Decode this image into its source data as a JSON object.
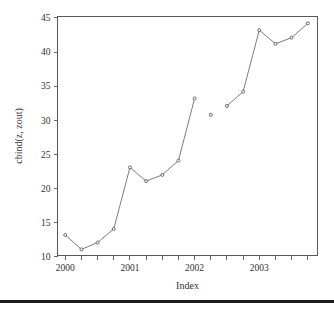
{
  "chart_data": {
    "type": "line",
    "title": "",
    "xlabel": "Index",
    "ylabel": "cbind(z, zout)",
    "xlim": [
      1999.88,
      2003.9
    ],
    "ylim": [
      10.2,
      45.2
    ],
    "grid": false,
    "legend": null,
    "x_ticks": [
      {
        "value": 2000,
        "label": "2000",
        "major": true
      },
      {
        "value": 2000.25,
        "label": "",
        "major": false
      },
      {
        "value": 2000.5,
        "label": "",
        "major": false
      },
      {
        "value": 2000.75,
        "label": "",
        "major": false
      },
      {
        "value": 2001,
        "label": "2001",
        "major": true
      },
      {
        "value": 2001.25,
        "label": "",
        "major": false
      },
      {
        "value": 2001.5,
        "label": "",
        "major": false
      },
      {
        "value": 2001.75,
        "label": "",
        "major": false
      },
      {
        "value": 2002,
        "label": "2002",
        "major": true
      },
      {
        "value": 2002.25,
        "label": "",
        "major": false
      },
      {
        "value": 2002.5,
        "label": "",
        "major": false
      },
      {
        "value": 2002.75,
        "label": "",
        "major": false
      },
      {
        "value": 2003,
        "label": "2003",
        "major": true
      },
      {
        "value": 2003.25,
        "label": "",
        "major": false
      },
      {
        "value": 2003.5,
        "label": "",
        "major": false
      },
      {
        "value": 2003.75,
        "label": "",
        "major": false
      }
    ],
    "y_ticks": [
      {
        "value": 10,
        "label": "10"
      },
      {
        "value": 15,
        "label": "15"
      },
      {
        "value": 20,
        "label": "20"
      },
      {
        "value": 25,
        "label": "25"
      },
      {
        "value": 30,
        "label": "30"
      },
      {
        "value": 35,
        "label": "35"
      },
      {
        "value": 40,
        "label": "40"
      },
      {
        "value": 45,
        "label": "45"
      }
    ],
    "x": [
      2000,
      2000.25,
      2000.5,
      2000.75,
      2001,
      2001.25,
      2001.5,
      2001.75,
      2002,
      2002.25,
      2002.5,
      2002.75,
      2003,
      2003.25,
      2003.5,
      2003.75
    ],
    "values": [
      13.2,
      11.1,
      12.1,
      14.1,
      23.1,
      21.1,
      22.0,
      24.1,
      33.2,
      30.8,
      32.1,
      34.2,
      43.2,
      41.2,
      42.1,
      44.2
    ],
    "segments": [
      {
        "name": "z",
        "points": [
          {
            "x": 2000,
            "y": 13.2
          },
          {
            "x": 2000.25,
            "y": 11.1
          },
          {
            "x": 2000.5,
            "y": 12.1
          },
          {
            "x": 2000.75,
            "y": 14.1
          },
          {
            "x": 2001,
            "y": 23.1
          },
          {
            "x": 2001.25,
            "y": 21.1
          },
          {
            "x": 2001.5,
            "y": 22.0
          },
          {
            "x": 2001.75,
            "y": 24.1
          },
          {
            "x": 2002,
            "y": 33.2
          }
        ]
      },
      {
        "name": "isolated",
        "points": [
          {
            "x": 2002.25,
            "y": 30.8
          }
        ]
      },
      {
        "name": "zout",
        "points": [
          {
            "x": 2002.5,
            "y": 32.1
          },
          {
            "x": 2002.75,
            "y": 34.2
          },
          {
            "x": 2003,
            "y": 43.2
          },
          {
            "x": 2003.25,
            "y": 41.2
          },
          {
            "x": 2003.5,
            "y": 42.1
          },
          {
            "x": 2003.75,
            "y": 44.2
          }
        ]
      }
    ],
    "colors": {
      "line": "#6d6d72",
      "point_stroke": "#58585a",
      "point_fill": "#ffffff",
      "axis": "#58585a",
      "text": "#2f2f31",
      "background": "#ffffff",
      "rule": "#1c1c1c"
    }
  }
}
